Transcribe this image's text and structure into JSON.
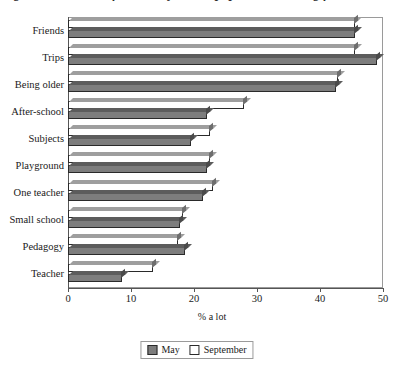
{
  "title": "Figure 3. Features of secondary school pupils were looking forward to",
  "axis": {
    "x_title": "% a lot",
    "x_ticks": [
      "0",
      "10",
      "20",
      "30",
      "40",
      "50"
    ],
    "x_min": 0,
    "x_max": 50,
    "x_step": 10
  },
  "legend": {
    "items": [
      {
        "label": "May",
        "swatch": "may-swatch",
        "color": "#7d7d7d"
      },
      {
        "label": "September",
        "swatch": "september-swatch",
        "color": "#ffffff"
      }
    ]
  },
  "chart_data": {
    "type": "bar",
    "orientation": "horizontal",
    "title": "Figure 3. Features of secondary school pupils were looking forward to",
    "xlabel": "% a lot",
    "ylabel": "",
    "xlim": [
      0,
      50
    ],
    "xticks": [
      0,
      10,
      20,
      30,
      40,
      50
    ],
    "grid": false,
    "legend_position": "bottom",
    "categories": [
      "Friends",
      "Trips",
      "Being older",
      "After-school",
      "Subjects",
      "Playground",
      "One teacher",
      "Small school",
      "Pedagogy",
      "Teacher"
    ],
    "series": [
      {
        "name": "May",
        "values": [
          45.5,
          49.0,
          42.5,
          22.0,
          19.5,
          22.0,
          21.5,
          17.8,
          18.5,
          8.5
        ]
      },
      {
        "name": "September",
        "values": [
          45.5,
          45.5,
          42.8,
          28.0,
          22.5,
          22.5,
          23.0,
          18.2,
          17.5,
          13.5
        ]
      }
    ]
  }
}
